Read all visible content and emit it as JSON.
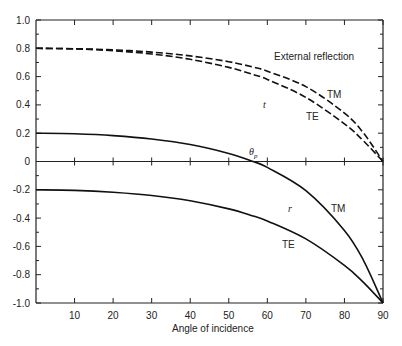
{
  "chart_data": {
    "type": "line",
    "title": "",
    "xlabel": "Angle of incidence",
    "ylabel": "",
    "xlim": [
      0,
      90
    ],
    "ylim": [
      -1.0,
      1.0
    ],
    "grid": false,
    "x_ticks": [
      10,
      20,
      30,
      40,
      50,
      60,
      70,
      80,
      90
    ],
    "y_ticks": [
      1.0,
      0.8,
      0.6,
      0.4,
      0.2,
      0,
      -0.2,
      -0.4,
      -0.6,
      -0.8,
      -1.0
    ],
    "y_tick_labels": [
      "1.0",
      "0.8",
      "0.6",
      "0.4",
      "0.2",
      "0",
      "-0.2",
      "-0.4",
      "-0.6",
      "-0.8",
      "-1.0"
    ],
    "x": [
      0,
      10,
      20,
      30,
      40,
      50,
      56.3,
      60,
      70,
      80,
      85,
      90
    ],
    "series": [
      {
        "name": "t TM",
        "style": "dashed",
        "values": [
          0.8,
          0.797,
          0.789,
          0.773,
          0.746,
          0.705,
          0.667,
          0.638,
          0.529,
          0.342,
          0.199,
          0.0
        ]
      },
      {
        "name": "t TE",
        "style": "dashed",
        "values": [
          0.8,
          0.796,
          0.783,
          0.76,
          0.722,
          0.665,
          0.615,
          0.58,
          0.453,
          0.266,
          0.144,
          0.0
        ]
      },
      {
        "name": "r TM",
        "style": "solid",
        "values": [
          0.2,
          0.196,
          0.183,
          0.159,
          0.12,
          0.057,
          0.0,
          -0.042,
          -0.206,
          -0.487,
          -0.702,
          -1.0
        ]
      },
      {
        "name": "r TE",
        "style": "solid",
        "values": [
          -0.2,
          -0.204,
          -0.217,
          -0.24,
          -0.278,
          -0.335,
          -0.385,
          -0.42,
          -0.547,
          -0.734,
          -0.856,
          -1.0
        ]
      }
    ],
    "annotations": [
      {
        "text": "External reflection",
        "x": 64,
        "y": 0.745
      },
      {
        "text": "TM",
        "x": 77,
        "y": 0.21,
        "refers_to": "t TM"
      },
      {
        "text": "t",
        "x": 60.5,
        "y": 0.4
      },
      {
        "text": "TE",
        "x": 71,
        "y": 0.25,
        "refers_to": "t TE"
      },
      {
        "text": "θp",
        "x": 56,
        "y": 0.05,
        "note": "Brewster angle where r TM = 0"
      },
      {
        "text": "r",
        "x": 66,
        "y": -0.3
      },
      {
        "text": "TM",
        "x": 78,
        "y": -0.3,
        "refers_to": "r TM"
      },
      {
        "text": "TE",
        "x": 66.5,
        "y": -0.55,
        "refers_to": "r TE"
      }
    ]
  },
  "labels": {
    "xlabel": "Angle of incidence",
    "external": "External reflection",
    "tm_top": "TM",
    "t": "t",
    "te_top": "TE",
    "theta": "θ",
    "theta_sub": "p",
    "r": "r",
    "tm_bottom": "TM",
    "te_bottom": "TE"
  }
}
